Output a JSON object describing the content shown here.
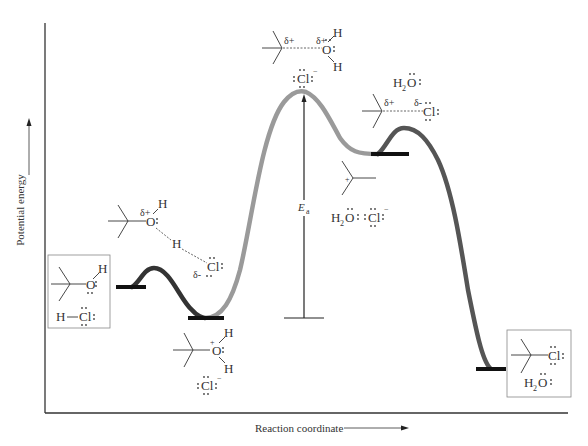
{
  "diagram": {
    "type": "reaction_energy_profile",
    "axes": {
      "y_label": "Potential energy",
      "x_label": "Reaction coordinate"
    },
    "activation_energy_label": "E",
    "activation_energy_subscript": "a",
    "curve_colors": {
      "step1": "#333333",
      "step2": "#9a9a9a",
      "step3": "#555555",
      "levels": "#111111"
    },
    "species": {
      "reactants": {
        "alcohol_oh": "O",
        "alcohol_h": "H",
        "hcl_h": "H",
        "hcl_cl": "Cl"
      },
      "ts1": {
        "delta_plus": "δ+",
        "o": "O",
        "h_top": "H",
        "h_mid": "H",
        "cl": "Cl",
        "delta_minus": "δ-"
      },
      "intermediate1": {
        "o": "O",
        "plus": "+",
        "h_top": "H",
        "h_bottom": "H",
        "cl": "Cl",
        "cl_charge": "−"
      },
      "ts2": {
        "delta_plus_c": "δ+",
        "delta_plus_o": "δ+",
        "o": "O",
        "h_top": "H",
        "h_bottom": "H",
        "cl": "Cl",
        "cl_charge": "−"
      },
      "intermediate2": {
        "plus": "+",
        "water": "H",
        "water_sub": "2",
        "water_o": "O",
        "cl": "Cl",
        "cl_charge": "−"
      },
      "ts3": {
        "water": "H",
        "water_sub": "2",
        "water_o": "O",
        "delta_plus": "δ+",
        "delta_minus": "δ-",
        "cl": "Cl"
      },
      "products": {
        "cl": "Cl",
        "water": "H",
        "water_sub": "2",
        "water_o": "O"
      }
    }
  }
}
